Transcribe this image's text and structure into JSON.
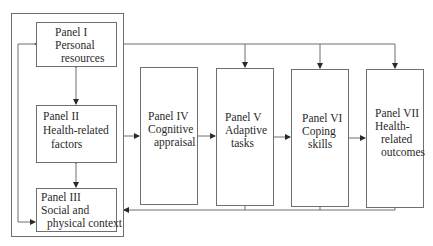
{
  "diagram": {
    "panels": [
      {
        "id": "I",
        "lines": [
          "Panel I",
          "Personal",
          "resources"
        ]
      },
      {
        "id": "II",
        "lines": [
          "Panel II",
          "Health-related",
          "factors"
        ]
      },
      {
        "id": "III",
        "lines": [
          "Panel III",
          "Social and",
          "physical context"
        ]
      },
      {
        "id": "IV",
        "lines": [
          "Panel IV",
          "Cognitive",
          "appraisal"
        ]
      },
      {
        "id": "V",
        "lines": [
          "Panel V",
          "Adaptive",
          "tasks"
        ]
      },
      {
        "id": "VI",
        "lines": [
          "Panel VI",
          "Coping",
          "skills"
        ]
      },
      {
        "id": "VII",
        "lines": [
          "Panel VII",
          "Health-",
          "related",
          "outcomes"
        ]
      }
    ],
    "colors": {
      "line": "#6f6f6f",
      "arrow": "#2a2a2a",
      "text": "#2a2a2a"
    }
  }
}
